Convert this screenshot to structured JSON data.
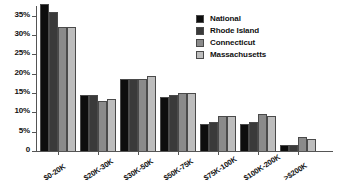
{
  "chart_data": {
    "type": "bar",
    "title": "",
    "subtitle": "",
    "xlabel": "",
    "ylabel": "",
    "ylim": [
      0,
      37.5
    ],
    "grid": false,
    "legend_position": "top-right",
    "categories": [
      "$0-20K",
      "$20K-30K",
      "$30K-50K",
      "$50K-75K",
      "$75K-100K",
      "$100K-200K",
      ">$200K"
    ],
    "ytick_labels": [
      "0",
      "5%",
      "10%",
      "15%",
      "20%",
      "25%",
      "30%",
      "35%"
    ],
    "ytick_values": [
      0,
      5,
      10,
      15,
      20,
      25,
      30,
      35
    ],
    "series": [
      {
        "name": "National",
        "color": "#0d0d0d",
        "values": [
          38.0,
          14.5,
          18.5,
          14.0,
          7.0,
          7.0,
          1.5
        ]
      },
      {
        "name": "Rhode Island",
        "color": "#3a3a3a",
        "values": [
          36.0,
          14.5,
          18.5,
          14.5,
          7.5,
          7.5,
          1.5
        ]
      },
      {
        "name": "Connecticut",
        "color": "#8a8a8a",
        "values": [
          32.0,
          13.0,
          18.5,
          15.0,
          9.0,
          9.5,
          3.5
        ]
      },
      {
        "name": "Massachusetts",
        "color": "#bdbdbd",
        "values": [
          32.0,
          13.5,
          19.5,
          15.0,
          9.0,
          9.0,
          3.0
        ]
      }
    ]
  }
}
